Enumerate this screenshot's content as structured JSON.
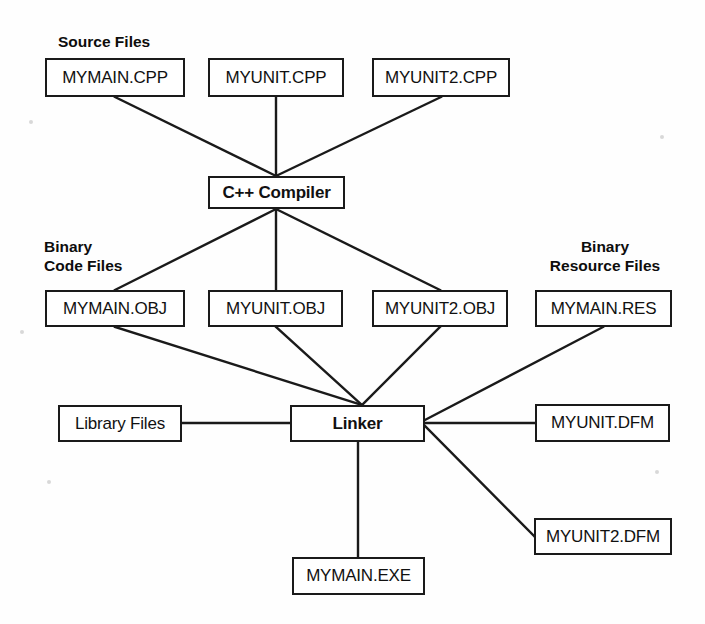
{
  "diagram": {
    "line_color": "#1a1a1a",
    "box_border_color": "#1a1a1a",
    "background_color": "#fefefe",
    "captions": [
      {
        "id": "source-files",
        "text": "Source Files",
        "x": 58,
        "y": 32,
        "width": 150,
        "align": "left"
      },
      {
        "id": "binary-code-files",
        "text": "Binary\nCode Files",
        "x": 44,
        "y": 237,
        "width": 120,
        "align": "left"
      },
      {
        "id": "binary-resource-files",
        "text": "Binary\nResource Files",
        "x": 520,
        "y": 237,
        "width": 170,
        "align": "center"
      }
    ],
    "nodes": [
      {
        "id": "mymain-cpp",
        "label": "MYMAIN.CPP",
        "x": 45,
        "y": 58,
        "w": 140,
        "h": 39,
        "bold": false
      },
      {
        "id": "myunit-cpp",
        "label": "MYUNIT.CPP",
        "x": 208,
        "y": 58,
        "w": 136,
        "h": 39,
        "bold": false
      },
      {
        "id": "myunit2-cpp",
        "label": "MYUNIT2.CPP",
        "x": 372,
        "y": 58,
        "w": 138,
        "h": 39,
        "bold": false
      },
      {
        "id": "cpp-compiler",
        "label": "C++ Compiler",
        "x": 208,
        "y": 176,
        "w": 137,
        "h": 33,
        "bold": true
      },
      {
        "id": "mymain-obj",
        "label": "MYMAIN.OBJ",
        "x": 45,
        "y": 290,
        "w": 140,
        "h": 37,
        "bold": false
      },
      {
        "id": "myunit-obj",
        "label": "MYUNIT.OBJ",
        "x": 208,
        "y": 290,
        "w": 135,
        "h": 37,
        "bold": false
      },
      {
        "id": "myunit2-obj",
        "label": "MYUNIT2.OBJ",
        "x": 372,
        "y": 290,
        "w": 136,
        "h": 37,
        "bold": false
      },
      {
        "id": "mymain-res",
        "label": "MYMAIN.RES",
        "x": 535,
        "y": 290,
        "w": 137,
        "h": 37,
        "bold": false
      },
      {
        "id": "library-files",
        "label": "Library Files",
        "x": 58,
        "y": 405,
        "w": 124,
        "h": 37,
        "bold": false
      },
      {
        "id": "linker",
        "label": "Linker",
        "x": 290,
        "y": 405,
        "w": 135,
        "h": 37,
        "bold": true
      },
      {
        "id": "myunit-dfm",
        "label": "MYUNIT.DFM",
        "x": 535,
        "y": 404,
        "w": 135,
        "h": 38,
        "bold": false
      },
      {
        "id": "myunit2-dfm",
        "label": "MYUNIT2.DFM",
        "x": 534,
        "y": 518,
        "w": 138,
        "h": 37,
        "bold": false
      },
      {
        "id": "mymain-exe",
        "label": "MYMAIN.EXE",
        "x": 292,
        "y": 557,
        "w": 133,
        "h": 38,
        "bold": false
      }
    ],
    "edges": [
      {
        "id": "mymain-cpp-to-compiler",
        "from": "mymain-cpp",
        "to": "cpp-compiler",
        "x1": 115,
        "y1": 97,
        "x2": 276,
        "y2": 176
      },
      {
        "id": "myunit-cpp-to-compiler",
        "from": "myunit-cpp",
        "to": "cpp-compiler",
        "x1": 276,
        "y1": 97,
        "x2": 276,
        "y2": 176
      },
      {
        "id": "myunit2-cpp-to-compiler",
        "from": "myunit2-cpp",
        "to": "cpp-compiler",
        "x1": 441,
        "y1": 97,
        "x2": 276,
        "y2": 176
      },
      {
        "id": "compiler-to-mymain-obj",
        "from": "cpp-compiler",
        "to": "mymain-obj",
        "x1": 276,
        "y1": 209,
        "x2": 115,
        "y2": 290
      },
      {
        "id": "compiler-to-myunit-obj",
        "from": "cpp-compiler",
        "to": "myunit-obj",
        "x1": 276,
        "y1": 209,
        "x2": 276,
        "y2": 290
      },
      {
        "id": "compiler-to-myunit2-obj",
        "from": "cpp-compiler",
        "to": "myunit2-obj",
        "x1": 276,
        "y1": 209,
        "x2": 440,
        "y2": 290
      },
      {
        "id": "mymain-obj-to-linker",
        "from": "mymain-obj",
        "to": "linker",
        "x1": 115,
        "y1": 327,
        "x2": 362,
        "y2": 405
      },
      {
        "id": "myunit-obj-to-linker",
        "from": "myunit-obj",
        "to": "linker",
        "x1": 276,
        "y1": 327,
        "x2": 362,
        "y2": 405
      },
      {
        "id": "myunit2-obj-to-linker",
        "from": "myunit2-obj",
        "to": "linker",
        "x1": 440,
        "y1": 327,
        "x2": 362,
        "y2": 405
      },
      {
        "id": "mymain-res-to-linker",
        "from": "mymain-res",
        "to": "linker",
        "x1": 603,
        "y1": 327,
        "x2": 425,
        "y2": 420
      },
      {
        "id": "library-files-to-linker",
        "from": "library-files",
        "to": "linker",
        "x1": 182,
        "y1": 423,
        "x2": 290,
        "y2": 423
      },
      {
        "id": "myunit-dfm-to-linker",
        "from": "myunit-dfm",
        "to": "linker",
        "x1": 535,
        "y1": 423,
        "x2": 425,
        "y2": 423
      },
      {
        "id": "myunit2-dfm-to-linker",
        "from": "myunit2-dfm",
        "to": "linker",
        "x1": 534,
        "y1": 536,
        "x2": 425,
        "y2": 426
      },
      {
        "id": "linker-to-mymain-exe",
        "from": "linker",
        "to": "mymain-exe",
        "x1": 358,
        "y1": 442,
        "x2": 358,
        "y2": 557
      }
    ],
    "specks": [
      {
        "x": 29,
        "y": 120
      },
      {
        "x": 660,
        "y": 135
      },
      {
        "x": 20,
        "y": 330
      },
      {
        "x": 47,
        "y": 480
      },
      {
        "x": 655,
        "y": 470
      }
    ]
  }
}
